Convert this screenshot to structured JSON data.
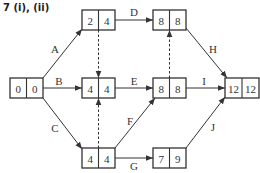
{
  "title": "7 (i), (ii)",
  "nodes": [
    {
      "id": "n1",
      "early": "0",
      "late": "0",
      "x": 10,
      "y": 78
    },
    {
      "id": "n2",
      "early": "2",
      "late": "4",
      "x": 82,
      "y": 10
    },
    {
      "id": "n3",
      "early": "4",
      "late": "4",
      "x": 82,
      "y": 78
    },
    {
      "id": "n4",
      "early": "4",
      "late": "4",
      "x": 82,
      "y": 148
    },
    {
      "id": "n5",
      "early": "8",
      "late": "8",
      "x": 153,
      "y": 10
    },
    {
      "id": "n6",
      "early": "8",
      "late": "8",
      "x": 153,
      "y": 78
    },
    {
      "id": "n7",
      "early": "7",
      "late": "9",
      "x": 153,
      "y": 148
    },
    {
      "id": "n8",
      "early": "12",
      "late": "12",
      "x": 225,
      "y": 78
    }
  ],
  "activities": [
    {
      "label": "A",
      "from": "n1",
      "to": "n2"
    },
    {
      "label": "B",
      "from": "n1",
      "to": "n3"
    },
    {
      "label": "C",
      "from": "n1",
      "to": "n4"
    },
    {
      "label": "D",
      "from": "n2",
      "to": "n5"
    },
    {
      "label": "E",
      "from": "n3",
      "to": "n6"
    },
    {
      "label": "F",
      "from": "n4",
      "to": "n6"
    },
    {
      "label": "G",
      "from": "n4",
      "to": "n7"
    },
    {
      "label": "H",
      "from": "n5",
      "to": "n8"
    },
    {
      "label": "I",
      "from": "n6",
      "to": "n8"
    },
    {
      "label": "J",
      "from": "n7",
      "to": "n8"
    }
  ],
  "dummies": [
    {
      "from": "n2",
      "to": "n3"
    },
    {
      "from": "n4",
      "to": "n3"
    },
    {
      "from": "n6",
      "to": "n5"
    }
  ]
}
